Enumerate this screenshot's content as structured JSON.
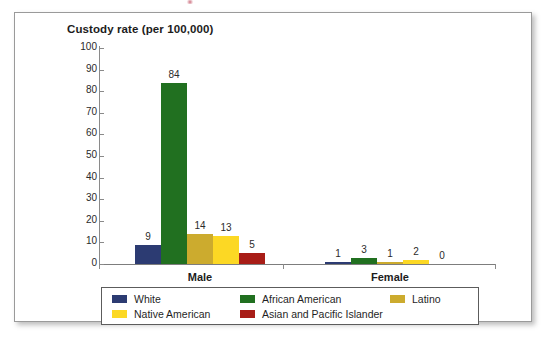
{
  "chart_data": {
    "type": "bar",
    "title": "Custody rate (per 100,000)",
    "xlabel": "",
    "ylabel": "",
    "ylim": [
      0,
      100
    ],
    "yticks": [
      100,
      90,
      80,
      70,
      60,
      50,
      40,
      30,
      20,
      10,
      0
    ],
    "grid": false,
    "legend_position": "bottom",
    "categories": [
      "Male",
      "Female"
    ],
    "series": [
      {
        "name": "White",
        "color": "#2c3b72",
        "values": [
          9,
          1
        ]
      },
      {
        "name": "African American",
        "color": "#217020",
        "values": [
          84,
          3
        ]
      },
      {
        "name": "Latino",
        "color": "#ccab2e",
        "values": [
          14,
          1
        ]
      },
      {
        "name": "Native American",
        "color": "#fcd824",
        "values": [
          13,
          2
        ]
      },
      {
        "name": "Asian and Pacific Islander",
        "color": "#a81d17",
        "values": [
          5,
          0
        ]
      }
    ],
    "legend_entries": [
      {
        "label": "White",
        "color": "#2c3b72"
      },
      {
        "label": "African American",
        "color": "#217020"
      },
      {
        "label": "Latino",
        "color": "#ccab2e"
      },
      {
        "label": "Native American",
        "color": "#fcd824"
      },
      {
        "label": "Asian and Pacific Islander",
        "color": "#a81d17"
      }
    ],
    "data_labels": {
      "Male": [
        "9",
        "84",
        "14",
        "13",
        "5"
      ],
      "Female": [
        "1",
        "3",
        "1",
        "2",
        "0"
      ]
    }
  },
  "colors": {
    "frame_border": "#9a9a9a",
    "axis": "#8a8a8a",
    "text": "#1c1c1c",
    "legend_border": "#5c5c5c",
    "background": "#ffffff"
  }
}
